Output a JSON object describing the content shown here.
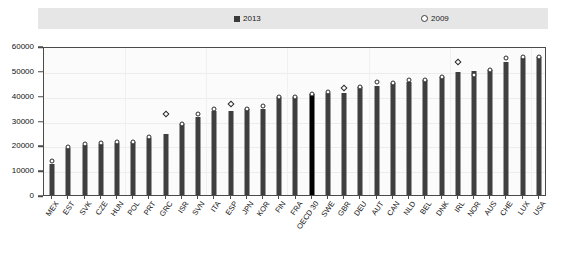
{
  "legend": {
    "entries": [
      {
        "label": "2013",
        "marker": "filled-square",
        "color": "#3a3a3a"
      },
      {
        "label": "2009",
        "marker": "open-circle",
        "color": "#3a3a3a"
      }
    ]
  },
  "axis": {
    "y_ticks": [
      "0",
      "10000",
      "20000",
      "30000",
      "40000",
      "50000",
      "60000"
    ]
  },
  "chart_data": {
    "type": "bar",
    "title": "",
    "subtitle": "",
    "xlabel": "",
    "ylabel": "",
    "ylim": [
      0,
      60000
    ],
    "ytick_step": 10000,
    "grid": true,
    "legend_position": "top",
    "highlight_category": "OECD 30",
    "highlight_color": "#000000",
    "bar_color": "#3f3f3f",
    "marker_color": "#ffffff",
    "categories": [
      "MEX",
      "EST",
      "SVK",
      "CZE",
      "HUN",
      "POL",
      "PRT",
      "GRC",
      "ISR",
      "SVN",
      "ITA",
      "ESP",
      "JPN",
      "KOR",
      "FIN",
      "FRA",
      "OECD 30",
      "SWE",
      "GBR",
      "DEU",
      "AUT",
      "CAN",
      "NLD",
      "BEL",
      "DNK",
      "IRL",
      "NOR",
      "AUS",
      "CHE",
      "LUX",
      "USA"
    ],
    "series": [
      {
        "name": "2013",
        "type": "bar",
        "values": [
          12500,
          19000,
          20000,
          20500,
          21000,
          21500,
          23000,
          24500,
          28500,
          31500,
          34000,
          34000,
          34500,
          34500,
          39500,
          39500,
          40500,
          41000,
          41000,
          43500,
          44000,
          45000,
          45500,
          46500,
          47500,
          49500,
          50000,
          50500,
          53500,
          55000,
          55500
        ]
      },
      {
        "name": "2009",
        "type": "scatter",
        "values": [
          13500,
          19500,
          20500,
          21000,
          21500,
          21500,
          23500,
          32500,
          28500,
          32500,
          34500,
          36500,
          34500,
          36000,
          39500,
          39500,
          40500,
          41500,
          43000,
          43500,
          45500,
          45000,
          46500,
          46500,
          47500,
          53500,
          48500,
          50500,
          55000,
          55500,
          55500
        ]
      }
    ]
  }
}
